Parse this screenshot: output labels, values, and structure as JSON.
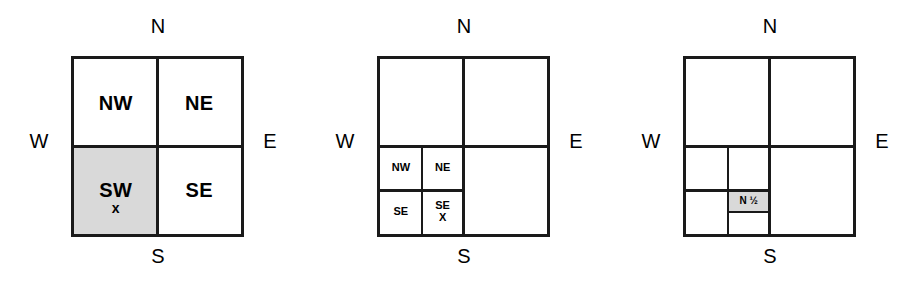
{
  "figure": {
    "caption": "",
    "background_color": "#ffffff",
    "line_color": "#1a1a1a",
    "shade_color": "#d9d9d9"
  },
  "compass": {
    "north": "N",
    "south": "S",
    "west": "W",
    "east": "E"
  },
  "diagrams": [
    {
      "id": "diagram-1",
      "name": "quadrant-labels",
      "quadrants": {
        "nw": {
          "label": "NW",
          "shaded": false,
          "marker": ""
        },
        "ne": {
          "label": "NE",
          "shaded": false,
          "marker": ""
        },
        "sw": {
          "label": "SW",
          "shaded": true,
          "marker": "x"
        },
        "se": {
          "label": "SE",
          "shaded": false,
          "marker": ""
        }
      }
    },
    {
      "id": "diagram-2",
      "name": "sw-quadrant-subdivided",
      "quadrants": {
        "nw": {
          "label": "",
          "shaded": false,
          "marker": ""
        },
        "ne": {
          "label": "",
          "shaded": false,
          "marker": ""
        },
        "sw": {
          "label": "",
          "shaded": false,
          "marker": ""
        },
        "se": {
          "label": "",
          "shaded": false,
          "marker": ""
        }
      },
      "subcells": {
        "nw": {
          "label": "NW",
          "shaded": false,
          "marker": ""
        },
        "ne": {
          "label": "NE",
          "shaded": false,
          "marker": ""
        },
        "sw": {
          "label": "SE",
          "shaded": false,
          "marker": ""
        },
        "se": {
          "label": "SE",
          "shaded": true,
          "marker": "X"
        }
      }
    },
    {
      "id": "diagram-3",
      "name": "sw-subcell-halved",
      "quadrants": {
        "nw": {
          "label": "",
          "shaded": false,
          "marker": ""
        },
        "ne": {
          "label": "",
          "shaded": false,
          "marker": ""
        },
        "sw": {
          "label": "",
          "shaded": false,
          "marker": ""
        },
        "se": {
          "label": "",
          "shaded": false,
          "marker": ""
        }
      },
      "subcells": {
        "nw": {
          "label": "",
          "shaded": false,
          "marker": ""
        },
        "ne": {
          "label": "",
          "shaded": false,
          "marker": ""
        },
        "sw": {
          "label": "",
          "shaded": false,
          "marker": ""
        },
        "se": {
          "label": "",
          "shaded": false,
          "marker": ""
        }
      },
      "leaves": {
        "top": {
          "label": "N ½",
          "shaded": true
        },
        "bottom": {
          "label": "",
          "shaded": false
        }
      }
    }
  ]
}
